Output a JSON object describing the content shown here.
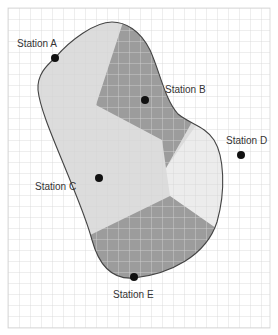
{
  "diagram": {
    "type": "voronoi-map",
    "colors": {
      "background": "#ffffff",
      "grid": "#d4d4d4",
      "outline": "#444444",
      "region_a": "#d9d9d9",
      "region_b": "#9c9c9c",
      "region_c": "#dddddd",
      "region_d": "#ececec",
      "region_e": "#9c9c9c",
      "dot": "#111111"
    },
    "stations": [
      {
        "id": "A",
        "label": "Station A",
        "x": 55,
        "y": 58,
        "label_x": 17,
        "label_y": 38
      },
      {
        "id": "B",
        "label": "Station B",
        "x": 145,
        "y": 100,
        "label_x": 165,
        "label_y": 84
      },
      {
        "id": "C",
        "label": "Station C",
        "x": 99,
        "y": 178,
        "label_x": 35,
        "label_y": 181
      },
      {
        "id": "D",
        "label": "Station D",
        "x": 241,
        "y": 155,
        "label_x": 226,
        "label_y": 135
      },
      {
        "id": "E",
        "label": "Station E",
        "x": 134,
        "y": 277,
        "label_x": 113,
        "label_y": 289
      }
    ]
  }
}
